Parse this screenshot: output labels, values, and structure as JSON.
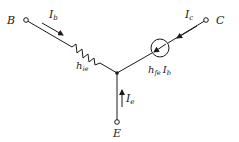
{
  "diagram": {
    "type": "circuit-schematic",
    "title": "",
    "terminals": {
      "base": {
        "label": "B"
      },
      "collector": {
        "label": "C"
      },
      "emitter": {
        "label": "E"
      }
    },
    "currents": {
      "base": {
        "symbol": "I",
        "subscript": "b"
      },
      "collector": {
        "symbol": "I",
        "subscript": "c"
      },
      "emitter": {
        "symbol": "I",
        "subscript": "e"
      }
    },
    "components": {
      "resistor": {
        "symbol": "h",
        "subscript": "ie"
      },
      "current_source": {
        "symbol": "h",
        "subscript": "fe",
        "times_symbol": "I",
        "times_subscript": "b"
      }
    },
    "colors": {
      "ink": "#1a1a1a",
      "background": "#ffffff"
    }
  }
}
